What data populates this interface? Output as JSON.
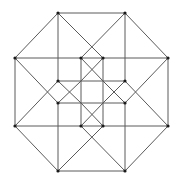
{
  "diagram": {
    "type": "graph",
    "colors": {
      "edge": "#5a5a5a",
      "vertex": "#1a1a1a",
      "background": "#ffffff"
    },
    "vertices": [
      {
        "id": "o1",
        "x": 58,
        "y": 13
      },
      {
        "id": "o2",
        "x": 125,
        "y": 13
      },
      {
        "id": "o3",
        "x": 168,
        "y": 58
      },
      {
        "id": "o4",
        "x": 168,
        "y": 126
      },
      {
        "id": "o5",
        "x": 125,
        "y": 171
      },
      {
        "id": "o6",
        "x": 58,
        "y": 171
      },
      {
        "id": "o7",
        "x": 15,
        "y": 126
      },
      {
        "id": "o8",
        "x": 15,
        "y": 58
      },
      {
        "id": "i1",
        "x": 81,
        "y": 58
      },
      {
        "id": "i2",
        "x": 103,
        "y": 58
      },
      {
        "id": "i3",
        "x": 125,
        "y": 81
      },
      {
        "id": "i4",
        "x": 125,
        "y": 103
      },
      {
        "id": "i5",
        "x": 103,
        "y": 126
      },
      {
        "id": "i6",
        "x": 81,
        "y": 126
      },
      {
        "id": "i7",
        "x": 58,
        "y": 103
      },
      {
        "id": "i8",
        "x": 58,
        "y": 81
      }
    ],
    "segments": [
      [
        58,
        13,
        125,
        13
      ],
      [
        125,
        13,
        168,
        58
      ],
      [
        168,
        58,
        168,
        126
      ],
      [
        168,
        126,
        125,
        171
      ],
      [
        125,
        171,
        58,
        171
      ],
      [
        58,
        171,
        15,
        126
      ],
      [
        15,
        126,
        15,
        58
      ],
      [
        15,
        58,
        58,
        13
      ],
      [
        15,
        58,
        168,
        58
      ],
      [
        15,
        126,
        168,
        126
      ],
      [
        58,
        13,
        58,
        81
      ],
      [
        58,
        103,
        58,
        171
      ],
      [
        125,
        13,
        125,
        81
      ],
      [
        125,
        103,
        125,
        171
      ],
      [
        58,
        81,
        125,
        81
      ],
      [
        58,
        103,
        125,
        103
      ],
      [
        81,
        58,
        81,
        126
      ],
      [
        103,
        58,
        103,
        126
      ],
      [
        58,
        13,
        103,
        58
      ],
      [
        125,
        13,
        81,
        58
      ],
      [
        168,
        58,
        125,
        103
      ],
      [
        168,
        126,
        125,
        81
      ],
      [
        125,
        171,
        81,
        126
      ],
      [
        58,
        171,
        103,
        126
      ],
      [
        15,
        126,
        58,
        81
      ],
      [
        15,
        58,
        58,
        103
      ],
      [
        81,
        58,
        103,
        81
      ],
      [
        103,
        58,
        81,
        81
      ],
      [
        125,
        81,
        103,
        103
      ],
      [
        125,
        103,
        103,
        81
      ],
      [
        81,
        103,
        103,
        126
      ],
      [
        103,
        103,
        81,
        126
      ],
      [
        58,
        81,
        81,
        103
      ],
      [
        58,
        103,
        81,
        81
      ]
    ]
  }
}
